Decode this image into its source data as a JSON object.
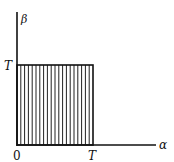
{
  "diagram": {
    "axes": {
      "x_label": "α",
      "y_label": "β",
      "origin_label": "0"
    },
    "ticks": {
      "x_tick_label": "T",
      "y_tick_label": "T"
    },
    "region": {
      "shape": "square",
      "fill": "vertical-hatch",
      "hatch_line_count": 20,
      "x_range": [
        "0",
        "T"
      ],
      "y_range": [
        "0",
        "T"
      ]
    },
    "colors": {
      "line": "#111111",
      "background": "#ffffff"
    }
  }
}
